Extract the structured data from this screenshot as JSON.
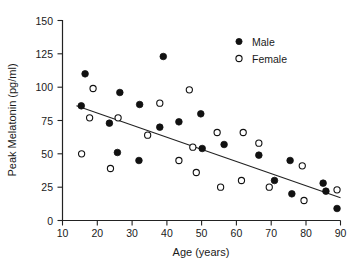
{
  "chart_data": {
    "type": "scatter",
    "title": "",
    "xlabel": "Age (years)",
    "ylabel": "Peak Melatonin (pg/ml)",
    "xlim": [
      10,
      90
    ],
    "ylim": [
      0,
      150
    ],
    "xticks": [
      10,
      20,
      30,
      40,
      50,
      60,
      70,
      80,
      90
    ],
    "yticks": [
      0,
      25,
      50,
      75,
      100,
      125,
      150
    ],
    "xtick_labels": [
      "10",
      "20",
      "30",
      "40",
      "50",
      "60",
      "70",
      "80",
      "90"
    ],
    "ytick_labels": [
      "0",
      "25",
      "50",
      "75",
      "100",
      "125",
      "150"
    ],
    "grid": false,
    "legend_position": "top-right",
    "series": [
      {
        "name": "Male",
        "marker": "filled-circle",
        "color": "#111111",
        "points": [
          {
            "x": 15.4,
            "y": 86
          },
          {
            "x": 16.5,
            "y": 110
          },
          {
            "x": 23.5,
            "y": 73
          },
          {
            "x": 25.8,
            "y": 51
          },
          {
            "x": 26.5,
            "y": 96
          },
          {
            "x": 32.0,
            "y": 45
          },
          {
            "x": 32.2,
            "y": 87
          },
          {
            "x": 38.0,
            "y": 70
          },
          {
            "x": 39.0,
            "y": 123
          },
          {
            "x": 43.5,
            "y": 74
          },
          {
            "x": 49.8,
            "y": 80
          },
          {
            "x": 50.2,
            "y": 54
          },
          {
            "x": 56.5,
            "y": 57
          },
          {
            "x": 66.5,
            "y": 49
          },
          {
            "x": 71.0,
            "y": 30
          },
          {
            "x": 75.5,
            "y": 45
          },
          {
            "x": 76.0,
            "y": 20
          },
          {
            "x": 85.0,
            "y": 28
          },
          {
            "x": 85.8,
            "y": 22
          },
          {
            "x": 89.0,
            "y": 9
          }
        ]
      },
      {
        "name": "Female",
        "marker": "open-circle",
        "color": "#111111",
        "points": [
          {
            "x": 15.5,
            "y": 50
          },
          {
            "x": 17.8,
            "y": 77
          },
          {
            "x": 18.8,
            "y": 99
          },
          {
            "x": 23.8,
            "y": 39
          },
          {
            "x": 26.0,
            "y": 77
          },
          {
            "x": 34.5,
            "y": 64
          },
          {
            "x": 38.0,
            "y": 88
          },
          {
            "x": 43.5,
            "y": 45
          },
          {
            "x": 46.5,
            "y": 98
          },
          {
            "x": 47.5,
            "y": 55
          },
          {
            "x": 48.5,
            "y": 36
          },
          {
            "x": 54.5,
            "y": 66
          },
          {
            "x": 55.5,
            "y": 25
          },
          {
            "x": 61.5,
            "y": 30
          },
          {
            "x": 62.0,
            "y": 66
          },
          {
            "x": 66.5,
            "y": 58
          },
          {
            "x": 69.5,
            "y": 25
          },
          {
            "x": 79.0,
            "y": 41
          },
          {
            "x": 79.5,
            "y": 15
          },
          {
            "x": 89.0,
            "y": 23
          }
        ]
      }
    ],
    "trendline": {
      "name": "linear-fit",
      "x_start": 14,
      "y_start": 86,
      "x_end": 90,
      "y_end": 17
    }
  },
  "legend": {
    "entries": [
      {
        "label": "Male",
        "marker": "filled-circle"
      },
      {
        "label": "Female",
        "marker": "open-circle"
      }
    ]
  }
}
